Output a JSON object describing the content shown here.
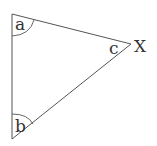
{
  "diagram": {
    "type": "triangle",
    "stroke_color": "#555555",
    "vertices": [
      {
        "id": "top-left",
        "x": 12,
        "y": 14,
        "angle_label": "a"
      },
      {
        "id": "bottom-left",
        "x": 12,
        "y": 139,
        "angle_label": "b"
      },
      {
        "id": "right",
        "x": 131,
        "y": 44,
        "angle_label": "c",
        "point_label": "X"
      }
    ],
    "labels": {
      "angle_a": "a",
      "angle_b": "b",
      "angle_c": "c",
      "point_x": "X"
    }
  }
}
